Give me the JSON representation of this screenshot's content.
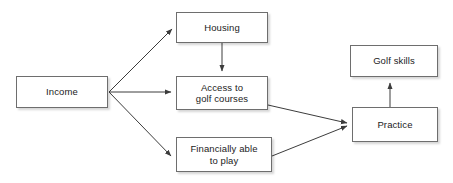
{
  "diagram": {
    "type": "flow-diagram",
    "canvas": {
      "width": 453,
      "height": 183,
      "background": "#ffffff"
    },
    "style": {
      "node_fill": "#ffffff",
      "node_border": "#6e6e6e",
      "edge_color": "#3c3c3c",
      "text_color": "#1b1b1b"
    },
    "nodes": [
      {
        "id": "income",
        "label": "Income",
        "x": 16,
        "y": 76,
        "w": 92,
        "h": 32
      },
      {
        "id": "housing",
        "label": "Housing",
        "x": 176,
        "y": 12,
        "w": 92,
        "h": 31
      },
      {
        "id": "access",
        "label": "Access to\ngolf courses",
        "x": 176,
        "y": 76,
        "w": 92,
        "h": 34
      },
      {
        "id": "financially_able",
        "label": "Financially able\nto play",
        "x": 176,
        "y": 137,
        "w": 96,
        "h": 35
      },
      {
        "id": "practice",
        "label": "Practice",
        "x": 352,
        "y": 107,
        "w": 86,
        "h": 35
      },
      {
        "id": "golf_skills",
        "label": "Golf skills",
        "x": 350,
        "y": 45,
        "w": 88,
        "h": 32
      }
    ],
    "edges": [
      {
        "id": "income-housing",
        "from": "income",
        "to": "housing",
        "label": ""
      },
      {
        "id": "income-access",
        "from": "income",
        "to": "access",
        "label": ""
      },
      {
        "id": "income-financially-able",
        "from": "income",
        "to": "financially_able",
        "label": ""
      },
      {
        "id": "housing-access",
        "from": "housing",
        "to": "access",
        "label": ""
      },
      {
        "id": "access-practice",
        "from": "access",
        "to": "practice",
        "label": ""
      },
      {
        "id": "financially-able-practice",
        "from": "financially_able",
        "to": "practice",
        "label": ""
      },
      {
        "id": "practice-golf-skills",
        "from": "practice",
        "to": "golf_skills",
        "label": ""
      }
    ]
  }
}
